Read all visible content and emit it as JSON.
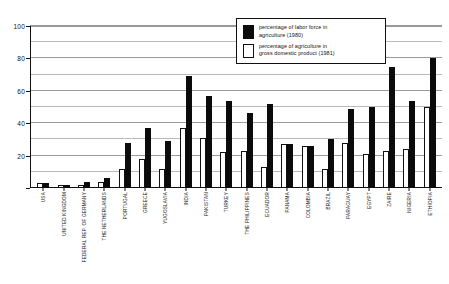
{
  "chart_data": {
    "type": "bar",
    "title": "",
    "xlabel": "",
    "ylabel": "",
    "ylim": [
      0,
      100
    ],
    "yticks": [
      0,
      20,
      40,
      60,
      80,
      100
    ],
    "ytick_labels": [
      "",
      "20",
      "40",
      "60",
      "80",
      "100"
    ],
    "gridlines_every": 10,
    "grid": true,
    "legend_position": "top-right",
    "categories": [
      "USA",
      "UNITED KINGDOM",
      "FEDERAL REP. OF GERMANY",
      "THE NETHERLANDS",
      "PORTUGAL",
      "GREECE",
      "YUGOSLAVIA",
      "INDIA",
      "PAKISTAN",
      "TURKEY",
      "THE PHILIPPINES",
      "ECUADOR",
      "PANAMA",
      "COLOMBIA",
      "BRAZIL",
      "PARAGUAY",
      "EGYPT",
      "ZAIRE",
      "NIGERIA",
      "ETHIOPIA"
    ],
    "series": [
      {
        "name": "percentage of labor force in agriculture (1980)",
        "color": "#0b0b0b",
        "values": [
          3,
          2,
          4,
          6,
          28,
          37,
          29,
          69,
          57,
          54,
          46,
          52,
          27,
          26,
          30,
          49,
          50,
          75,
          54,
          80
        ]
      },
      {
        "name": "percentage of agriculture in gross domestic product (1981)",
        "color": "#ffffff",
        "values": [
          3,
          2,
          2,
          4,
          12,
          18,
          12,
          37,
          31,
          22,
          23,
          13,
          27,
          26,
          12,
          28,
          21,
          23,
          24,
          50
        ]
      }
    ],
    "legend": [
      {
        "swatch": "dark",
        "line1": "percentage of labor force in",
        "line2": "agriculture (1980)"
      },
      {
        "swatch": "light",
        "line1": "percentage of agriculture in",
        "line2": "gross domestic product (1981)"
      }
    ]
  }
}
